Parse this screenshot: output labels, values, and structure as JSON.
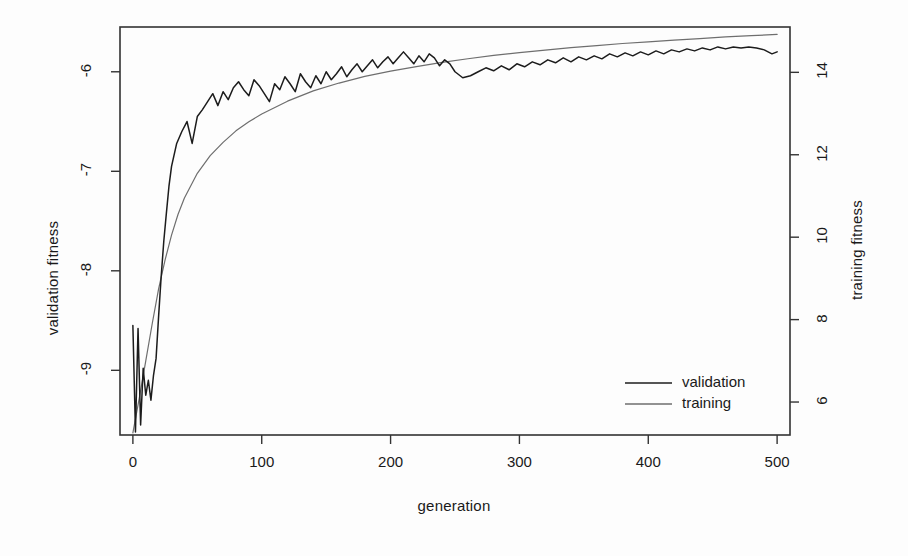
{
  "chart_data": {
    "type": "line",
    "title": "",
    "xlabel": "generation",
    "ylabel": "validation fitness",
    "y2label": "training fitness",
    "xlim": [
      -10,
      510
    ],
    "ylim": [
      -9.65,
      -5.55
    ],
    "y2lim": [
      5.2,
      15.1
    ],
    "grid": false,
    "legend_position": "bottom-right",
    "xticks": [
      "0",
      "100",
      "200",
      "300",
      "400",
      "500"
    ],
    "xtick_values": [
      0,
      100,
      200,
      300,
      400,
      500
    ],
    "yticks": [
      "-6",
      "-7",
      "-8",
      "-9"
    ],
    "ytick_values": [
      -6,
      -7,
      -8,
      -9
    ],
    "y2ticks": [
      "14",
      "12",
      "10",
      "8",
      "6"
    ],
    "y2tick_values": [
      14,
      12,
      10,
      8,
      6
    ],
    "series": [
      {
        "name": "validation",
        "axis": "left",
        "color": "#1c1c1c",
        "style": "noisy",
        "x": [
          0,
          2,
          4,
          6,
          8,
          10,
          12,
          14,
          16,
          18,
          20,
          22,
          24,
          26,
          28,
          30,
          34,
          38,
          42,
          46,
          50,
          54,
          58,
          62,
          66,
          70,
          74,
          78,
          82,
          86,
          90,
          94,
          98,
          102,
          106,
          110,
          114,
          118,
          122,
          126,
          130,
          134,
          138,
          142,
          146,
          150,
          154,
          158,
          162,
          166,
          170,
          174,
          178,
          182,
          186,
          190,
          194,
          198,
          202,
          206,
          210,
          214,
          218,
          222,
          226,
          230,
          234,
          238,
          242,
          246,
          250,
          256,
          262,
          268,
          274,
          280,
          286,
          292,
          298,
          304,
          310,
          316,
          322,
          328,
          334,
          340,
          346,
          352,
          358,
          364,
          370,
          376,
          382,
          388,
          394,
          400,
          406,
          412,
          418,
          424,
          430,
          436,
          442,
          448,
          454,
          460,
          466,
          472,
          478,
          484,
          490,
          496,
          500
        ],
        "y": [
          -8.55,
          -9.62,
          -8.58,
          -9.55,
          -8.98,
          -9.25,
          -9.1,
          -9.3,
          -9.05,
          -8.88,
          -8.45,
          -8.05,
          -7.7,
          -7.42,
          -7.15,
          -6.95,
          -6.72,
          -6.6,
          -6.5,
          -6.72,
          -6.45,
          -6.38,
          -6.3,
          -6.22,
          -6.34,
          -6.2,
          -6.28,
          -6.16,
          -6.1,
          -6.18,
          -6.24,
          -6.08,
          -6.14,
          -6.22,
          -6.3,
          -6.12,
          -6.18,
          -6.05,
          -6.12,
          -6.2,
          -6.02,
          -6.1,
          -6.16,
          -6.04,
          -6.12,
          -6.0,
          -6.08,
          -6.02,
          -5.95,
          -6.05,
          -5.98,
          -5.92,
          -6.0,
          -5.94,
          -5.88,
          -5.96,
          -5.9,
          -5.85,
          -5.92,
          -5.86,
          -5.8,
          -5.86,
          -5.92,
          -5.84,
          -5.9,
          -5.82,
          -5.86,
          -5.94,
          -5.88,
          -5.92,
          -6.0,
          -6.06,
          -6.04,
          -6.0,
          -5.96,
          -5.99,
          -5.94,
          -5.98,
          -5.92,
          -5.95,
          -5.9,
          -5.93,
          -5.88,
          -5.91,
          -5.86,
          -5.9,
          -5.85,
          -5.88,
          -5.84,
          -5.87,
          -5.82,
          -5.85,
          -5.81,
          -5.84,
          -5.8,
          -5.83,
          -5.79,
          -5.82,
          -5.78,
          -5.8,
          -5.77,
          -5.79,
          -5.76,
          -5.78,
          -5.75,
          -5.77,
          -5.75,
          -5.76,
          -5.75,
          -5.76,
          -5.78,
          -5.82,
          -5.8
        ]
      },
      {
        "name": "training",
        "axis": "right",
        "color": "#6e6e6e",
        "style": "smooth",
        "x": [
          0,
          5,
          10,
          15,
          20,
          25,
          30,
          35,
          40,
          50,
          60,
          70,
          80,
          90,
          100,
          120,
          140,
          160,
          180,
          200,
          220,
          240,
          260,
          280,
          300,
          320,
          340,
          360,
          380,
          400,
          420,
          440,
          460,
          480,
          500
        ],
        "y": [
          5.25,
          6.1,
          7.0,
          7.9,
          8.75,
          9.45,
          10.05,
          10.55,
          10.95,
          11.55,
          11.98,
          12.3,
          12.58,
          12.8,
          12.99,
          13.3,
          13.55,
          13.74,
          13.9,
          14.03,
          14.14,
          14.24,
          14.33,
          14.41,
          14.48,
          14.54,
          14.6,
          14.65,
          14.7,
          14.74,
          14.78,
          14.82,
          14.86,
          14.89,
          14.92
        ]
      }
    ],
    "legend": [
      {
        "label": "validation",
        "color": "#1c1c1c"
      },
      {
        "label": "training",
        "color": "#6e6e6e"
      }
    ]
  },
  "axes": {
    "box_color": "#333333"
  }
}
